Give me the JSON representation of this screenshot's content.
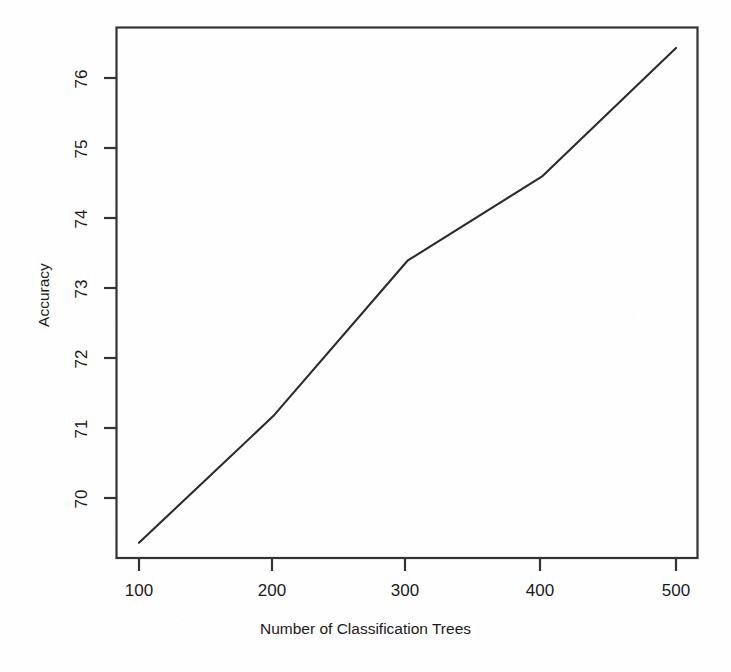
{
  "figure": {
    "background_color": "#fefefe",
    "line_color": "#2b2b2b",
    "axis_color": "#333333"
  },
  "axes": {
    "x_title": "Number of Classification Trees",
    "y_title": "Accuracy",
    "x_ticks": [
      "100",
      "200",
      "300",
      "400",
      "500"
    ],
    "y_ticks": [
      "70",
      "71",
      "72",
      "73",
      "74",
      "75",
      "76"
    ]
  },
  "chart_data": {
    "type": "line",
    "title": "",
    "xlabel": "Number of Classification Trees",
    "ylabel": "Accuracy",
    "x": [
      100,
      200,
      300,
      400,
      500
    ],
    "values": [
      69.36,
      71.17,
      73.39,
      74.59,
      76.43
    ],
    "series": [
      {
        "name": "Accuracy",
        "values": [
          69.36,
          71.17,
          73.39,
          74.59,
          76.43
        ]
      }
    ],
    "xlim": [
      85,
      500
    ],
    "ylim": [
      69.3,
      76.45
    ],
    "x_tick_values": [
      100,
      200,
      300,
      400,
      500
    ],
    "y_tick_values": [
      70,
      71,
      72,
      73,
      74,
      75,
      76
    ],
    "grid": false,
    "legend": false,
    "legend_position": "none",
    "markers": false,
    "annotations": []
  }
}
